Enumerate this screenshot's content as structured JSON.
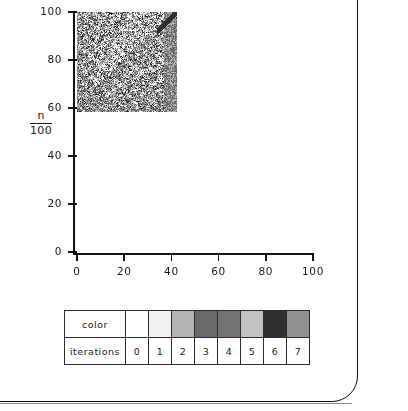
{
  "chart_data": {
    "type": "heatmap",
    "title": "",
    "subtitle": "",
    "xlabel": "",
    "ylabel": "n/100",
    "ylabel_numerator": "n",
    "ylabel_denominator": "100",
    "xlim": [
      0,
      100
    ],
    "ylim": [
      0,
      100
    ],
    "grid": false,
    "legend_position": "below-plot",
    "x_ticks": [
      "0",
      "20",
      "40",
      "60",
      "80",
      "100"
    ],
    "x_tick_values": [
      0,
      20,
      40,
      60,
      80,
      100
    ],
    "y_ticks": [
      "0",
      "20",
      "40",
      "60",
      "80",
      "100"
    ],
    "y_tick_values": [
      0,
      20,
      40,
      60,
      80,
      100
    ],
    "cells_x": 100,
    "cells_y": 100,
    "value_range": [
      0,
      7
    ],
    "value_name": "iterations",
    "colormap": [
      "#ffffff",
      "#f2f2f2",
      "#b3b3b3",
      "#6a6a6a",
      "#737373",
      "#c2c2c2",
      "#303030",
      "#919191"
    ]
  },
  "legend": {
    "row_labels": [
      "color",
      "iterations"
    ],
    "entries": [
      {
        "iterations": "0",
        "color": "#ffffff"
      },
      {
        "iterations": "1",
        "color": "#f2f2f2"
      },
      {
        "iterations": "2",
        "color": "#b3b3b3"
      },
      {
        "iterations": "3",
        "color": "#6a6a6a"
      },
      {
        "iterations": "4",
        "color": "#737373"
      },
      {
        "iterations": "5",
        "color": "#c2c2c2"
      },
      {
        "iterations": "6",
        "color": "#303030"
      },
      {
        "iterations": "7",
        "color": "#919191"
      }
    ]
  }
}
